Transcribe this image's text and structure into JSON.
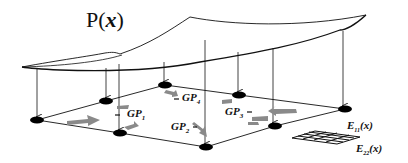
{
  "title": {
    "prefix": "P(",
    "var": "x",
    "suffix": ")"
  },
  "gauss_points": [
    {
      "name": "GP",
      "sub": "1"
    },
    {
      "name": "GP",
      "sub": "2"
    },
    {
      "name": "GP",
      "sub": "3"
    },
    {
      "name": "GP",
      "sub": "4"
    }
  ],
  "strain_labels": [
    {
      "name": "E",
      "sub": "11",
      "arg": "(x)"
    },
    {
      "name": "E",
      "sub": "22",
      "arg": "(x)"
    }
  ],
  "colors": {
    "line": "#111111",
    "node": "#000000",
    "flow_arrow": "#8a8a8a"
  }
}
